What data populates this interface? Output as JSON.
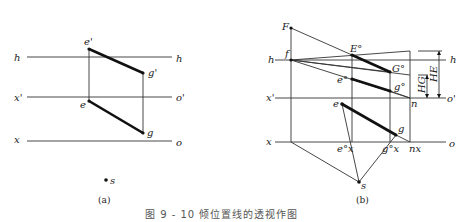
{
  "figure": {
    "caption": "图 9 - 10   倾位置线的透视作图",
    "panels": [
      {
        "id": "a",
        "label": "(a)",
        "lines": {
          "h_left": "h",
          "h_right": "h",
          "xprime_left": "x'",
          "oprime_right": "o'",
          "x_left": "x",
          "o_right": "o"
        },
        "points": {
          "e_prime": "e'",
          "g_prime": "g'",
          "e": "e",
          "g": "g",
          "s": "s"
        }
      },
      {
        "id": "b",
        "label": "(b)",
        "lines": {
          "h_left": "h",
          "h_right": "h",
          "xprime_left": "x'",
          "oprime_right": "o'",
          "x_left": "x",
          "o_right": "o"
        },
        "points": {
          "F": "F",
          "f": "f",
          "E0": "E°",
          "G0": "G°",
          "e0": "e°",
          "g0": "g°",
          "e": "e",
          "g": "g",
          "ex0": "e°x",
          "gx0": "g°x",
          "n": "n",
          "nx": "nx",
          "s": "s"
        },
        "dimensions": {
          "HG": "HG",
          "HE": "HE"
        }
      }
    ]
  }
}
